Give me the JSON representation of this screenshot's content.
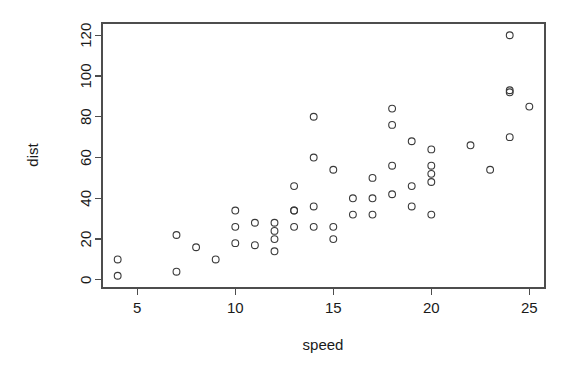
{
  "chart_data": {
    "type": "scatter",
    "title": "",
    "xlabel": "speed",
    "ylabel": "dist",
    "xlim": [
      3.2,
      25.8
    ],
    "ylim": [
      -4,
      126
    ],
    "xticks": [
      5,
      10,
      15,
      20,
      25
    ],
    "yticks": [
      0,
      20,
      40,
      60,
      80,
      100,
      120
    ],
    "xtick_labels": [
      "5",
      "10",
      "15",
      "20",
      "25"
    ],
    "ytick_labels": [
      "0",
      "20",
      "40",
      "60",
      "80",
      "100",
      "120"
    ],
    "grid": false,
    "legend": "none",
    "marker": "open-circle",
    "marker_radius_px": 3.4,
    "marker_color": "#3a3a3a",
    "axis_color": "#4d4d4d",
    "background": "#ffffff",
    "box": true,
    "n_points": 50,
    "x": [
      4,
      4,
      7,
      7,
      8,
      9,
      10,
      10,
      10,
      11,
      11,
      12,
      12,
      12,
      12,
      13,
      13,
      13,
      13,
      14,
      14,
      14,
      14,
      15,
      15,
      15,
      16,
      16,
      17,
      17,
      17,
      18,
      18,
      18,
      18,
      19,
      19,
      19,
      20,
      20,
      20,
      20,
      20,
      22,
      23,
      24,
      24,
      24,
      24,
      25
    ],
    "y": [
      2,
      10,
      4,
      22,
      16,
      10,
      18,
      26,
      34,
      17,
      28,
      14,
      20,
      24,
      28,
      26,
      34,
      34,
      46,
      26,
      36,
      60,
      80,
      20,
      26,
      54,
      32,
      40,
      32,
      40,
      50,
      42,
      56,
      76,
      84,
      36,
      46,
      68,
      32,
      48,
      52,
      56,
      64,
      66,
      54,
      70,
      92,
      93,
      120,
      85
    ],
    "points": [
      {
        "x": 4,
        "y": 2
      },
      {
        "x": 4,
        "y": 10
      },
      {
        "x": 7,
        "y": 4
      },
      {
        "x": 7,
        "y": 22
      },
      {
        "x": 8,
        "y": 16
      },
      {
        "x": 9,
        "y": 10
      },
      {
        "x": 10,
        "y": 18
      },
      {
        "x": 10,
        "y": 26
      },
      {
        "x": 10,
        "y": 34
      },
      {
        "x": 11,
        "y": 17
      },
      {
        "x": 11,
        "y": 28
      },
      {
        "x": 12,
        "y": 14
      },
      {
        "x": 12,
        "y": 20
      },
      {
        "x": 12,
        "y": 24
      },
      {
        "x": 12,
        "y": 28
      },
      {
        "x": 13,
        "y": 26
      },
      {
        "x": 13,
        "y": 34
      },
      {
        "x": 13,
        "y": 34
      },
      {
        "x": 13,
        "y": 46
      },
      {
        "x": 14,
        "y": 26
      },
      {
        "x": 14,
        "y": 36
      },
      {
        "x": 14,
        "y": 60
      },
      {
        "x": 14,
        "y": 80
      },
      {
        "x": 15,
        "y": 20
      },
      {
        "x": 15,
        "y": 26
      },
      {
        "x": 15,
        "y": 54
      },
      {
        "x": 16,
        "y": 32
      },
      {
        "x": 16,
        "y": 40
      },
      {
        "x": 17,
        "y": 32
      },
      {
        "x": 17,
        "y": 40
      },
      {
        "x": 17,
        "y": 50
      },
      {
        "x": 18,
        "y": 42
      },
      {
        "x": 18,
        "y": 56
      },
      {
        "x": 18,
        "y": 76
      },
      {
        "x": 18,
        "y": 84
      },
      {
        "x": 19,
        "y": 36
      },
      {
        "x": 19,
        "y": 46
      },
      {
        "x": 19,
        "y": 68
      },
      {
        "x": 20,
        "y": 32
      },
      {
        "x": 20,
        "y": 48
      },
      {
        "x": 20,
        "y": 52
      },
      {
        "x": 20,
        "y": 56
      },
      {
        "x": 20,
        "y": 64
      },
      {
        "x": 22,
        "y": 66
      },
      {
        "x": 23,
        "y": 54
      },
      {
        "x": 24,
        "y": 70
      },
      {
        "x": 24,
        "y": 92
      },
      {
        "x": 24,
        "y": 93
      },
      {
        "x": 24,
        "y": 120
      },
      {
        "x": 25,
        "y": 85
      }
    ]
  },
  "plot": {
    "xlabel": "speed",
    "ylabel": "dist"
  }
}
